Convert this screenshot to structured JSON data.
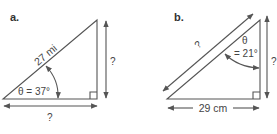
{
  "figures": [
    {
      "label": "a.",
      "hypotenuse": "27 mi",
      "angle": "θ = 37°",
      "opposite": "?",
      "adjacent": "?",
      "right_angle": true
    },
    {
      "label": "b.",
      "hypotenuse": "?",
      "angle_symbol": "θ",
      "angle_value": "= 21°",
      "opposite": "?",
      "adjacent": "29 cm",
      "right_angle": true
    }
  ]
}
